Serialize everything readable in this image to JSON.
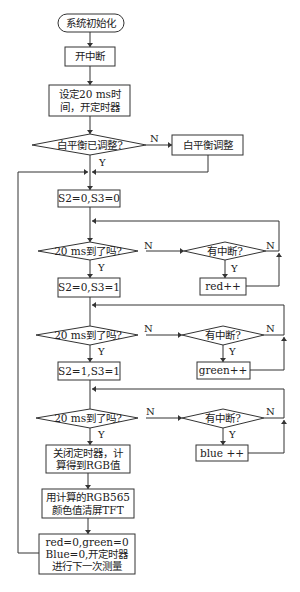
{
  "diagram": {
    "type": "flowchart",
    "nodes": {
      "start": "系统初始化",
      "enable_interrupt": "开中断",
      "set_timer_line1": "设定20 ms时",
      "set_timer_line2": "间，开定时器",
      "wb_check": "白平衡已调整?",
      "wb_adjust": "白平衡调整",
      "s_00": "S2=0,S3=0",
      "timeout_1": "20 ms到了吗?",
      "interrupt_1": "有中断?",
      "red_inc": "red++",
      "s_01": "S2=0,S3=1",
      "timeout_2": "20 ms到了吗?",
      "interrupt_2": "有中断?",
      "green_inc": "green++",
      "s_11": "S2=1,S3=1",
      "timeout_3": "20 ms到了吗?",
      "interrupt_3": "有中断?",
      "blue_inc": "blue ++",
      "close_timer_line1": "关闭定时器，计",
      "close_timer_line2": "算得到RGB值",
      "fill_tft_line1": "用计算的RGB565",
      "fill_tft_line2": "颜色值清屏TFT",
      "reset_line1": "red=0,green=0",
      "reset_line2": "Blue=0,开定时器",
      "reset_line3": "进行下一次测量"
    },
    "labels": {
      "yes": "Y",
      "no": "N"
    }
  }
}
